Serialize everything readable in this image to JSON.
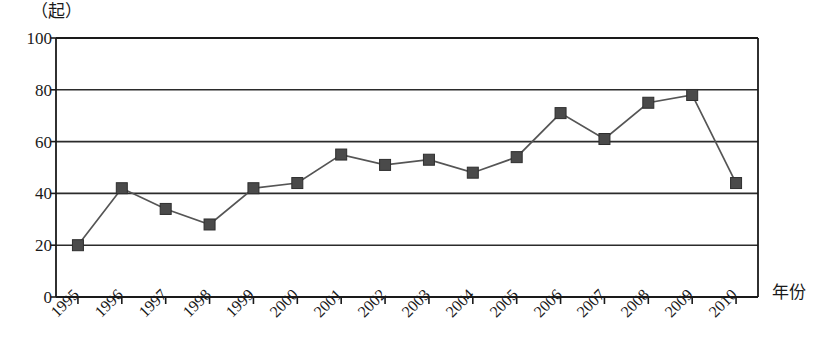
{
  "chart_data": {
    "type": "line",
    "title": "",
    "subtitle": "",
    "xlabel": "年份",
    "ylabel": "（起）",
    "unit_label": "（起）",
    "categories": [
      "1995",
      "1996",
      "1997",
      "1998",
      "1999",
      "2000",
      "2001",
      "2002",
      "2003",
      "2004",
      "2005",
      "2006",
      "2007",
      "2008",
      "2009",
      "2010"
    ],
    "x": [
      1995,
      1996,
      1997,
      1998,
      1999,
      2000,
      2001,
      2002,
      2003,
      2004,
      2005,
      2006,
      2007,
      2008,
      2009,
      2010
    ],
    "values": [
      20,
      42,
      34,
      28,
      42,
      44,
      55,
      51,
      53,
      48,
      54,
      71,
      61,
      75,
      78,
      44
    ],
    "series": [
      {
        "name": "",
        "values": [
          20,
          42,
          34,
          28,
          42,
          44,
          55,
          51,
          53,
          48,
          54,
          71,
          61,
          75,
          78,
          44
        ]
      }
    ],
    "ylim": [
      0,
      100
    ],
    "y_ticks": [
      0,
      20,
      40,
      60,
      80,
      100
    ],
    "y_tick_labels": [
      "0",
      "20",
      "40",
      "60",
      "80",
      "100"
    ],
    "x_tick_labels": [
      "1995",
      "1996",
      "1997",
      "1998",
      "1999",
      "2000",
      "2001",
      "2002",
      "2003",
      "2004",
      "2005",
      "2006",
      "2007",
      "2008",
      "2009",
      "2010"
    ],
    "grid": "horizontal",
    "legend": "none",
    "legend_entries": [],
    "annotations": [],
    "marker": "square",
    "colors": {
      "line": "#555555",
      "marker": "#4a4a4a",
      "axis": "#1a1a1a",
      "grid": "#2b2b2b",
      "background": "#ffffff",
      "text": "#1a1a1a"
    }
  }
}
